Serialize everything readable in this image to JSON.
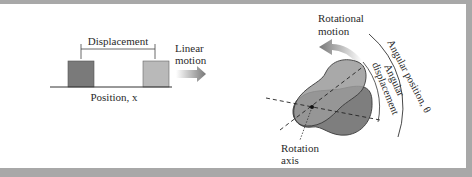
{
  "figure": {
    "linear": {
      "displacement_label": "Displacement",
      "motion_label_line1": "Linear",
      "motion_label_line2": "motion",
      "axis_label": "Position, x",
      "colors": {
        "box_start": "#7a7a7a",
        "box_end": "#b9b9b9",
        "line": "#333333",
        "arrow": "#7d7d7d"
      }
    },
    "rotational": {
      "motion_label_line1": "Rotational",
      "motion_label_line2": "motion",
      "angular_position_label": "Angular position, θ",
      "angular_displacement_line1": "Angular",
      "angular_displacement_line2": "displacement",
      "axis_label_line1": "Rotation",
      "axis_label_line2": "axis",
      "colors": {
        "body_start": "#9a9a9a",
        "body_end": "#7e7e7e",
        "outline": "#3a3a3a",
        "arrow": "#7d7d7d"
      }
    },
    "frame_color": "#a8a8a8"
  }
}
